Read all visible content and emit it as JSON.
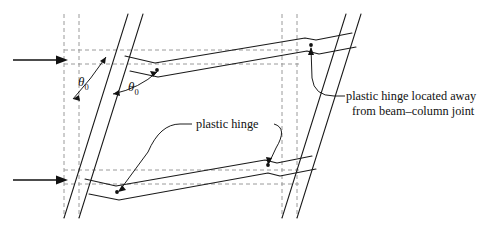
{
  "figure": {
    "type": "engineering-line-diagram",
    "width": 490,
    "height": 232,
    "background_color": "#ffffff",
    "line_color": "#1a1a1a",
    "dashed_color": "#9a9a9a"
  },
  "annotations": {
    "hinge_away": {
      "line1": "plastic hinge located away",
      "line2": "from beam–column joint"
    },
    "hinge_mid": "plastic hinge"
  },
  "angles": {
    "left": {
      "symbol": "θ",
      "subscript": "0"
    },
    "right": {
      "symbol": "θ",
      "subscript": "0"
    }
  },
  "loads": [
    {
      "name": "upper-lateral-load-arrow",
      "direction": "right",
      "y": 60
    },
    {
      "name": "lower-lateral-load-arrow",
      "direction": "right",
      "y": 180
    }
  ],
  "hinges": [
    {
      "name": "upper-beam-left-hinge",
      "x": 155,
      "y": 72
    },
    {
      "name": "upper-beam-right-hinge",
      "x": 311,
      "y": 46
    },
    {
      "name": "lower-beam-left-hinge",
      "x": 117,
      "y": 186
    },
    {
      "name": "lower-beam-right-hinge",
      "x": 268,
      "y": 164
    }
  ],
  "members": {
    "left_column_label": "left-column",
    "right_column_label": "right-column",
    "upper_beam_label": "upper-beam",
    "lower_beam_label": "lower-beam"
  },
  "reference_lines": {
    "undeformed_left_column": "dashed",
    "undeformed_right_column": "dashed",
    "undeformed_beam_levels": "dashed"
  }
}
